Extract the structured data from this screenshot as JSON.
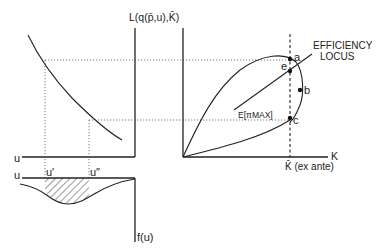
{
  "labels": {
    "y_axis_right": "L(q(p̄,u),K̄)",
    "x_axis_right": "K",
    "k_bar": "K̄ (ex ante)",
    "efficiency_locus": [
      "EFFICIENCY",
      "LOCUS"
    ],
    "e_pimax": "E[πMAX]",
    "point_a": "a",
    "point_e": "e",
    "point_b": "b",
    "point_c": "c",
    "u_left_axis": "u",
    "u_density_axis": "u",
    "u_prime": "u′",
    "u_double_prime": "u″",
    "density_axis": "f(u)"
  },
  "colors": {
    "ink": "#222222",
    "background": "#ffffff"
  }
}
